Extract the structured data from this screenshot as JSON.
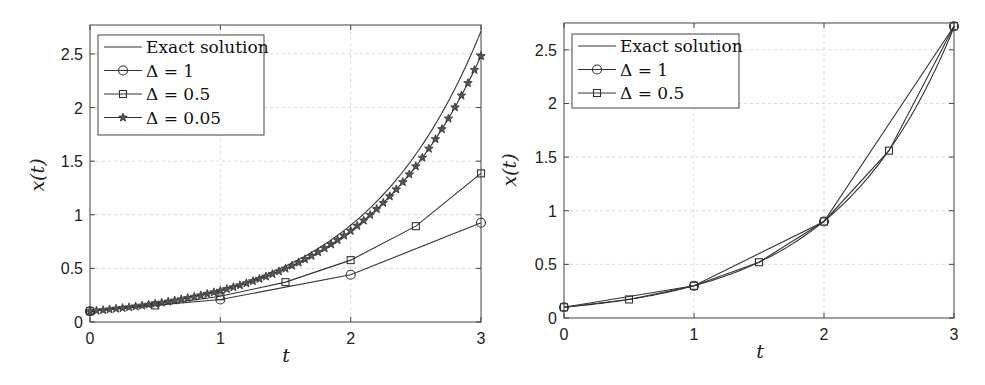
{
  "chart_data": [
    {
      "type": "line",
      "title": "",
      "xlabel": "t",
      "ylabel": "x(t)",
      "xlim": [
        0,
        3
      ],
      "ylim": [
        0,
        2.77
      ],
      "xticks": [
        0,
        1,
        2,
        3
      ],
      "xtick_labels": [
        "0",
        "1",
        "2",
        "3"
      ],
      "yticks": [
        0,
        0.5,
        1,
        1.5,
        2,
        2.5
      ],
      "ytick_labels": [
        "0",
        "0.5",
        "1",
        "1.5",
        "2",
        "2.5"
      ],
      "grid": true,
      "legend_position": "upper left",
      "series": [
        {
          "name": "Exact solution",
          "marker": "none",
          "function": "0.1*exp(1.1*t)",
          "x_start": 0,
          "x_end": 3
        },
        {
          "name": "Δ = 1",
          "marker": "circle",
          "x": [
            0,
            1,
            2,
            3
          ],
          "values": [
            0.1,
            0.21,
            0.441,
            0.926
          ]
        },
        {
          "name": "Δ = 0.5",
          "marker": "square",
          "x": [
            0,
            0.5,
            1,
            1.5,
            2,
            2.5,
            3
          ],
          "values": [
            0.1,
            0.155,
            0.24,
            0.372,
            0.577,
            0.894,
            1.386
          ]
        },
        {
          "name": "Δ = 0.05",
          "marker": "star",
          "step": 0.05,
          "growth_factor": 1.055,
          "x_start": 0,
          "x_end": 3,
          "start_value": 0.1,
          "end_value": 2.48
        }
      ],
      "legend_labels": [
        "Exact solution",
        "Δ = 1",
        "Δ = 0.5",
        "Δ = 0.05"
      ]
    },
    {
      "type": "line",
      "title": "",
      "xlabel": "t",
      "ylabel": "x(t)",
      "xlim": [
        0,
        3
      ],
      "ylim": [
        0,
        2.75
      ],
      "xticks": [
        0,
        1,
        2,
        3
      ],
      "xtick_labels": [
        "0",
        "1",
        "2",
        "3"
      ],
      "yticks": [
        0,
        0.5,
        1,
        1.5,
        2,
        2.5
      ],
      "ytick_labels": [
        "0",
        "0.5",
        "1",
        "1.5",
        "2",
        "2.5"
      ],
      "grid": true,
      "legend_position": "upper left",
      "series": [
        {
          "name": "Exact solution",
          "marker": "none",
          "function": "0.1*exp(1.1*t)",
          "x_start": 0,
          "x_end": 3
        },
        {
          "name": "Δ = 1",
          "marker": "circle",
          "x": [
            0,
            1,
            2,
            3
          ],
          "values": [
            0.1,
            0.3,
            0.9,
            2.72
          ]
        },
        {
          "name": "Δ = 0.5",
          "marker": "square",
          "x": [
            0,
            0.5,
            1,
            1.5,
            2,
            2.5,
            3
          ],
          "values": [
            0.1,
            0.173,
            0.3,
            0.52,
            0.9,
            1.56,
            2.72
          ]
        }
      ],
      "legend_labels": [
        "Exact solution",
        "Δ = 1",
        "Δ = 0.5"
      ]
    }
  ],
  "layout": {
    "panels": [
      {
        "left": 90,
        "right": 481,
        "top": 25,
        "bottom": 322,
        "legend": {
          "x": 98,
          "y": 35,
          "w": 166,
          "h": 100
        },
        "ylabel_x": 44,
        "ylabel_y": 175,
        "xlabel_x": 286,
        "xlabel_y": 362
      },
      {
        "left": 564,
        "right": 954,
        "top": 23,
        "bottom": 318,
        "legend": {
          "x": 572,
          "y": 34,
          "w": 167,
          "h": 74
        },
        "ylabel_x": 516,
        "ylabel_y": 170,
        "xlabel_x": 760,
        "xlabel_y": 358
      }
    ]
  },
  "colors": {
    "axes": "#444444",
    "line": "#333333",
    "grid": "#d0d0d0",
    "star_fill": "#555555"
  }
}
